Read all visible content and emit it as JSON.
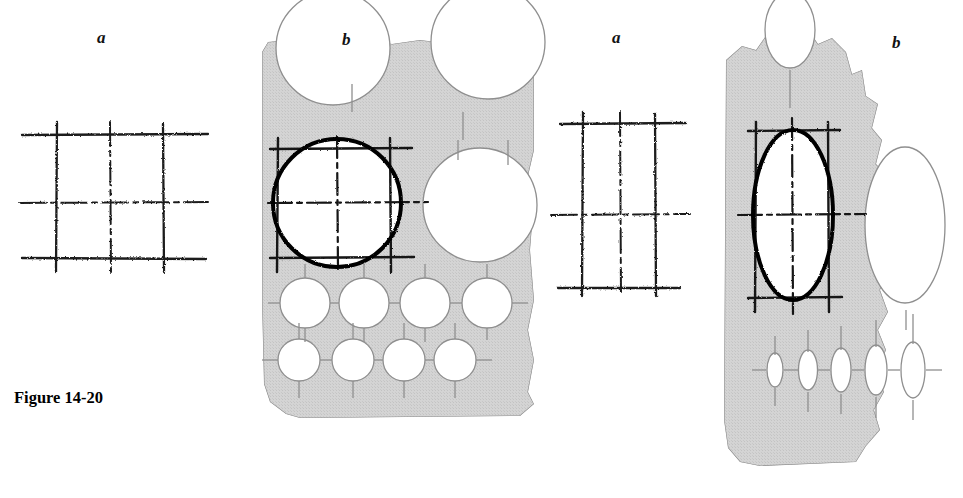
{
  "figure": {
    "caption": "Figure 14-20",
    "caption_x": 14,
    "caption_y": 388
  },
  "panels": [
    {
      "id": "circle-sketch",
      "label": "a",
      "label_x": 97,
      "label_y": 28,
      "kind": "freehand-sketch",
      "describes": "hand sketched square layout with dashed centerlines"
    },
    {
      "id": "circle-template",
      "label": "b",
      "label_x": 342,
      "label_y": 30,
      "kind": "circle-template",
      "describes": "circle drafting template with sketch overlaid on large circle opening"
    },
    {
      "id": "ellipse-sketch",
      "label": "a",
      "label_x": 612,
      "label_y": 28,
      "kind": "freehand-sketch",
      "describes": "hand sketched tall rectangle layout with dashed centerlines"
    },
    {
      "id": "ellipse-template",
      "label": "b",
      "label_x": 892,
      "label_y": 33,
      "kind": "ellipse-template",
      "describes": "ellipse drafting template with sketch overlaid on large ellipse opening"
    }
  ],
  "colors": {
    "template_fill": "#d2d2d2",
    "template_edge": "#8a8a8a",
    "opening_fill": "#ffffff",
    "sketch_ink": "#1a1a1a",
    "heavy_outline": "#000000",
    "background": "#ffffff"
  },
  "circle_template": {
    "large_openings": [
      {
        "cx": 337,
        "cy": 203,
        "r": 64,
        "role": "traced-circle"
      },
      {
        "cx": 333,
        "cy": 48,
        "r": 57,
        "role": "edge-scallop-top-left"
      },
      {
        "cx": 488,
        "cy": 42,
        "r": 57,
        "role": "edge-scallop-top-right"
      },
      {
        "cx": 480,
        "cy": 205,
        "r": 57,
        "role": "edge-scallop-right"
      }
    ],
    "hole_rows": [
      {
        "cy": 303,
        "radius": 25,
        "cx_list": [
          305,
          364,
          425,
          487
        ]
      },
      {
        "cy": 360,
        "radius": 21,
        "cx_list": [
          299,
          353,
          404,
          455
        ]
      }
    ]
  },
  "ellipse_template": {
    "large_openings": [
      {
        "cx": 793,
        "cy": 215,
        "rx": 40,
        "ry": 85,
        "role": "traced-ellipse"
      },
      {
        "cx": 790,
        "cy": 30,
        "rx": 25,
        "ry": 38,
        "role": "edge-notch-top"
      },
      {
        "cx": 905,
        "cy": 225,
        "rx": 40,
        "ry": 78,
        "role": "edge-scallop-right"
      }
    ],
    "small_ellipse_row": {
      "cy": 370,
      "items": [
        {
          "cx": 775,
          "rx": 8,
          "ry": 17
        },
        {
          "cx": 808,
          "rx": 9.5,
          "ry": 20
        },
        {
          "cx": 841,
          "rx": 10,
          "ry": 22
        },
        {
          "cx": 876,
          "rx": 11,
          "ry": 25
        },
        {
          "cx": 913,
          "rx": 12,
          "ry": 28
        }
      ]
    }
  },
  "sketch_left": {
    "x_lines": [
      57,
      110,
      163
    ],
    "y_lines": [
      135,
      203,
      258
    ],
    "h_span": [
      22,
      208
    ],
    "v_span": [
      122,
      272
    ]
  },
  "sketch_right": {
    "x_lines": [
      583,
      620,
      655
    ],
    "y_lines": [
      124,
      215,
      288
    ],
    "h_span": [
      551,
      690
    ],
    "v_span": [
      112,
      296
    ]
  }
}
